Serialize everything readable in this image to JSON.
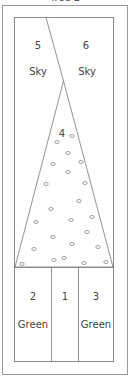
{
  "title": "Tree 2",
  "colors": {
    "frame": "#9a9a9a",
    "lines": "#777777",
    "text": "#444444",
    "background": "#ffffff"
  },
  "regions": [
    {
      "id": "5",
      "number": "5",
      "color_label": "Sky"
    },
    {
      "id": "6",
      "number": "6",
      "color_label": "Sky"
    },
    {
      "id": "4",
      "number": "4",
      "color_label": ""
    },
    {
      "id": "2",
      "number": "2",
      "color_label": "Green"
    },
    {
      "id": "1",
      "number": "1",
      "color_label": ""
    },
    {
      "id": "3",
      "number": "3",
      "color_label": "Green"
    }
  ],
  "ornaments": [
    [
      72,
      136
    ],
    [
      57,
      142
    ],
    [
      68,
      153
    ],
    [
      53,
      164
    ],
    [
      81,
      162
    ],
    [
      68,
      172
    ],
    [
      46,
      184
    ],
    [
      85,
      183
    ],
    [
      79,
      201
    ],
    [
      51,
      209
    ],
    [
      92,
      217
    ],
    [
      36,
      222
    ],
    [
      71,
      220
    ],
    [
      53,
      237
    ],
    [
      87,
      232
    ],
    [
      72,
      244
    ],
    [
      98,
      247
    ],
    [
      34,
      249
    ],
    [
      54,
      260
    ],
    [
      22,
      264
    ],
    [
      84,
      263
    ],
    [
      106,
      262
    ],
    [
      64,
      258
    ]
  ]
}
